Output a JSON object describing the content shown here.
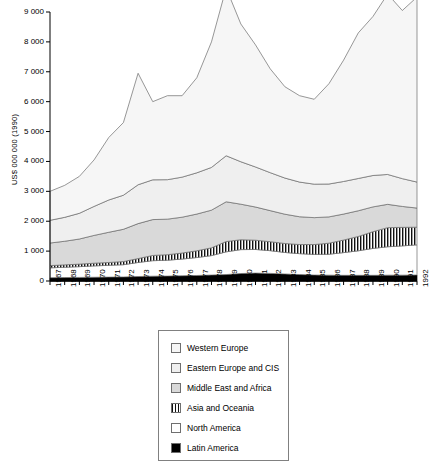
{
  "chart_data": {
    "type": "area",
    "stacked": true,
    "title": "",
    "subtitle": "",
    "xlabel": "",
    "ylabel": "US$ 000 000 (1990)",
    "xlim": [
      1967,
      1992
    ],
    "ylim": [
      0,
      9000
    ],
    "ytick_step": 1000,
    "grid": false,
    "legend_position": "below-center",
    "ytick_labels": [
      "0",
      "1 000",
      "2 000",
      "3 000",
      "4 000",
      "5 000",
      "6 000",
      "7 000",
      "8 000",
      "9 000"
    ],
    "ytick_values": [
      0,
      1000,
      2000,
      3000,
      4000,
      5000,
      6000,
      7000,
      8000,
      9000
    ],
    "categories": [
      "1967",
      "1968",
      "1969",
      "1970",
      "1971",
      "1972",
      "1973",
      "1974",
      "1975",
      "1976",
      "1977",
      "1978",
      "1979",
      "1980",
      "1981",
      "1982",
      "1983",
      "1984",
      "1985",
      "1986",
      "1987",
      "1988",
      "1989",
      "1990",
      "1991",
      "1992"
    ],
    "series": [
      {
        "name": "Latin America",
        "fill": "#000000",
        "pattern": "solid",
        "values": [
          110,
          115,
          120,
          125,
          130,
          135,
          150,
          160,
          165,
          175,
          185,
          200,
          215,
          250,
          265,
          255,
          235,
          215,
          200,
          195,
          190,
          190,
          190,
          195,
          195,
          200
        ]
      },
      {
        "name": "North America",
        "fill": "#ffffff",
        "pattern": "none",
        "values": [
          330,
          345,
          360,
          380,
          395,
          410,
          470,
          520,
          530,
          560,
          600,
          650,
          760,
          800,
          790,
          760,
          720,
          700,
          690,
          700,
          760,
          820,
          900,
          950,
          980,
          1010
        ]
      },
      {
        "name": "Asia and Oceania",
        "fill": "#ffffff",
        "pattern": "vertical-hatch",
        "values": [
          75,
          80,
          85,
          90,
          95,
          105,
          130,
          175,
          185,
          200,
          225,
          260,
          345,
          330,
          310,
          300,
          300,
          305,
          330,
          370,
          420,
          480,
          560,
          640,
          620,
          590
        ]
      },
      {
        "name": "Middle East and Africa",
        "fill": "#d9d9d9",
        "pattern": "solid",
        "values": [
          755,
          790,
          840,
          930,
          1010,
          1080,
          1170,
          1200,
          1190,
          1200,
          1230,
          1260,
          1330,
          1190,
          1110,
          1040,
          980,
          930,
          900,
          880,
          870,
          860,
          830,
          780,
          700,
          640
        ]
      },
      {
        "name": "Eastern Europe and CIS",
        "fill": "#efefef",
        "pattern": "solid",
        "values": [
          760,
          800,
          860,
          970,
          1080,
          1140,
          1300,
          1330,
          1320,
          1340,
          1380,
          1430,
          1540,
          1420,
          1340,
          1270,
          1210,
          1160,
          1120,
          1100,
          1090,
          1080,
          1050,
          1000,
          930,
          870
        ]
      },
      {
        "name": "Western Europe",
        "fill": "#f6f6f6",
        "pattern": "solid",
        "values": [
          970,
          1070,
          1235,
          1555,
          2090,
          2430,
          3730,
          2615,
          2810,
          2725,
          3180,
          4200,
          5610,
          4610,
          4085,
          3475,
          3055,
          2890,
          2840,
          3355,
          4060,
          4870,
          5320,
          6035,
          5625,
          6190
        ]
      }
    ],
    "totals": [
      3000,
      3200,
      3500,
      4050,
      4800,
      5300,
      6950,
      6000,
      6200,
      6200,
      6800,
      8000,
      8800,
      8600,
      7900,
      7100,
      6500,
      6200,
      6080,
      6600,
      7390,
      8300,
      8850,
      9600,
      9050,
      9500
    ],
    "annotations": []
  },
  "legend": {
    "items": [
      {
        "label": "Western Europe",
        "swatch": "light-grey-swatch"
      },
      {
        "label": "Eastern Europe and CIS",
        "swatch": "light-grey-swatch"
      },
      {
        "label": "Middle East and Africa",
        "swatch": "grey-swatch"
      },
      {
        "label": "Asia and Oceania",
        "swatch": "hatched-swatch"
      },
      {
        "label": "North America",
        "swatch": "white-swatch"
      },
      {
        "label": "Latin America",
        "swatch": "black-swatch"
      }
    ]
  },
  "colors": {
    "axis": "#000000",
    "plot_line": "#555555",
    "western_europe": "#f6f6f6",
    "eastern_europe": "#efefef",
    "middle_east_africa": "#d9d9d9",
    "asia_oceania": "#ffffff",
    "north_america": "#ffffff",
    "latin_america": "#000000",
    "legend_border": "#808080"
  }
}
